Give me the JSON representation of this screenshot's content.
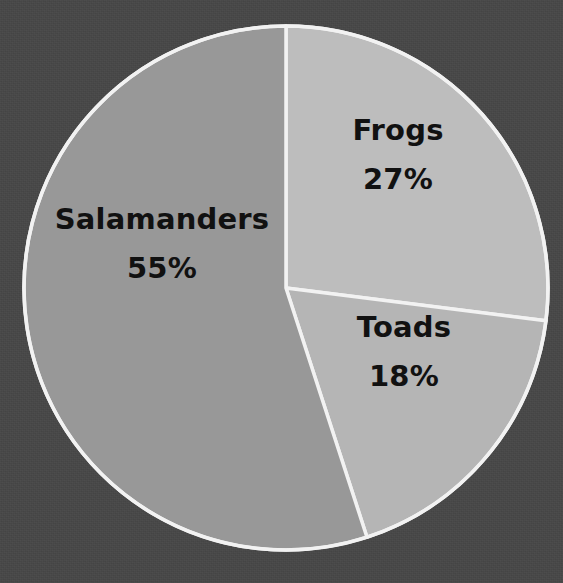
{
  "chart_data": {
    "type": "pie",
    "title": "",
    "subtitle": "",
    "xlabel": "",
    "ylabel": "",
    "legend_position": "none",
    "grid": false,
    "labels_inside_slices": true,
    "categories": [
      "Frogs",
      "Toads",
      "Salamanders"
    ],
    "values": [
      27,
      18,
      55
    ],
    "value_unit": "%",
    "start_angle_deg": 0,
    "direction": "clockwise",
    "slices": [
      {
        "name": "Frogs",
        "value": 27,
        "value_label": "27%",
        "color": "#bdbdbd",
        "start_angle_deg": 0,
        "end_angle_deg": 97.2,
        "label_x": 398,
        "label_y": 155
      },
      {
        "name": "Toads",
        "value": 18,
        "value_label": "18%",
        "color": "#b5b5b5",
        "start_angle_deg": 97.2,
        "end_angle_deg": 162,
        "label_x": 404,
        "label_y": 352
      },
      {
        "name": "Salamanders",
        "value": 55,
        "value_label": "55%",
        "color": "#989898",
        "start_angle_deg": 162,
        "end_angle_deg": 360,
        "label_x": 162,
        "label_y": 244
      }
    ],
    "geometry": {
      "center_x": 286,
      "center_y": 288,
      "radius": 262
    },
    "colors": {
      "background": "#474747",
      "divider": "#f2f2f2",
      "outline": "#f2f2f2",
      "label_text": "#111111"
    }
  }
}
